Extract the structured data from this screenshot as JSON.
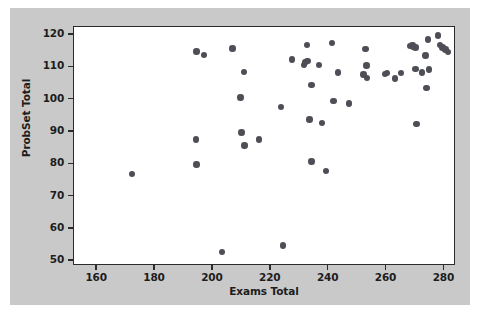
{
  "chart_data": {
    "type": "scatter",
    "title": "",
    "xlabel": "Exams Total",
    "ylabel": "ProbSet Total",
    "xlim": [
      152,
      284
    ],
    "ylim": [
      48.5,
      122.5
    ],
    "xticks": [
      160,
      180,
      200,
      220,
      240,
      260,
      280
    ],
    "yticks": [
      50,
      60,
      70,
      80,
      90,
      100,
      110,
      120
    ],
    "grid": false,
    "legend": null,
    "marker": {
      "shape": "circle",
      "color": "#4e4e56",
      "size": 6.5
    },
    "series": [
      {
        "name": "students",
        "points": [
          [
            172.0,
            77.0
          ],
          [
            194.3,
            114.9
          ],
          [
            197.0,
            113.8
          ],
          [
            194.2,
            87.7
          ],
          [
            194.4,
            79.9
          ],
          [
            203.2,
            52.9
          ],
          [
            206.8,
            115.8
          ],
          [
            209.6,
            100.7
          ],
          [
            209.8,
            89.9
          ],
          [
            210.8,
            108.6
          ],
          [
            211.0,
            85.8
          ],
          [
            216.0,
            87.6
          ],
          [
            223.6,
            97.8
          ],
          [
            224.2,
            54.9
          ],
          [
            227.3,
            112.4
          ],
          [
            231.5,
            110.8
          ],
          [
            232.0,
            111.6
          ],
          [
            232.7,
            111.9
          ],
          [
            232.5,
            116.9
          ],
          [
            233.3,
            93.8
          ],
          [
            234.0,
            104.6
          ],
          [
            234.1,
            80.9
          ],
          [
            236.7,
            110.7
          ],
          [
            237.7,
            92.7
          ],
          [
            239.0,
            77.9
          ],
          [
            241.2,
            117.6
          ],
          [
            241.6,
            99.6
          ],
          [
            243.2,
            108.4
          ],
          [
            247.0,
            98.8
          ],
          [
            252.0,
            107.8
          ],
          [
            252.8,
            115.7
          ],
          [
            253.0,
            110.6
          ],
          [
            253.3,
            106.7
          ],
          [
            259.5,
            107.9
          ],
          [
            260.2,
            108.2
          ],
          [
            263.0,
            106.6
          ],
          [
            265.0,
            108.3
          ],
          [
            268.3,
            116.6
          ],
          [
            269.0,
            116.9
          ],
          [
            269.3,
            116.3
          ],
          [
            270.0,
            116.2
          ],
          [
            270.0,
            109.5
          ],
          [
            270.4,
            92.5
          ],
          [
            272.3,
            108.4
          ],
          [
            273.4,
            113.6
          ],
          [
            273.8,
            103.6
          ],
          [
            274.3,
            118.6
          ],
          [
            274.6,
            109.4
          ],
          [
            277.8,
            119.8
          ],
          [
            278.4,
            117.0
          ],
          [
            279.3,
            116.2
          ],
          [
            280.3,
            115.6
          ],
          [
            281.3,
            114.8
          ]
        ]
      }
    ]
  }
}
